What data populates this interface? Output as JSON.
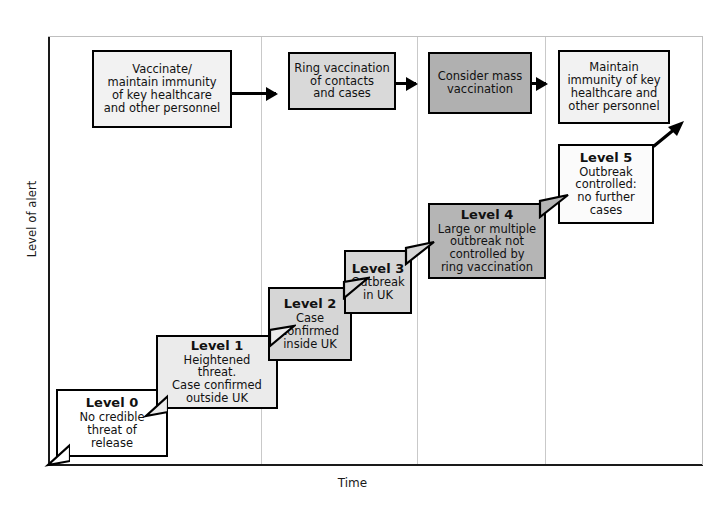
{
  "diagram": {
    "type": "step-escalation-diagram",
    "axes": {
      "y_label": "Level of alert",
      "x_label": "Time"
    },
    "colors": {
      "white": "#ffffff",
      "very_light_gray": "#ececec",
      "light_gray": "#dcdcdc",
      "medium_gray": "#c8c8c8",
      "dark_gray": "#a8a8a8",
      "outline": "#000000",
      "divider": "#c9c9c9",
      "axis": "#1a1a1a"
    }
  },
  "action_boxes": [
    {
      "id": "vaccinate-maintain-immunity",
      "text": "Vaccinate/\nmaintain immunity\nof key healthcare\nand other personnel",
      "fill": "#f2f2f2"
    },
    {
      "id": "ring-vaccination",
      "text": "Ring vaccination\nof contacts\nand cases",
      "fill": "#d9d9d9"
    },
    {
      "id": "consider-mass-vaccination",
      "text": "Consider mass\nvaccination",
      "fill": "#b0b0b0"
    },
    {
      "id": "maintain-immunity",
      "text": "Maintain\nimmunity of key\nhealthcare and\nother personnel",
      "fill": "#f2f2f2"
    }
  ],
  "level_boxes": [
    {
      "id": "level-0",
      "level": "Level 0",
      "description": "No credible\nthreat of\nrelease",
      "fill": "#ffffff"
    },
    {
      "id": "level-1",
      "level": "Level 1",
      "description": "Heightened\nthreat.\nCase confirmed\noutside UK",
      "fill": "#ebebeb"
    },
    {
      "id": "level-2",
      "level": "Level 2",
      "description": "Case\nconfirmed\ninside UK",
      "fill": "#d6d6d6"
    },
    {
      "id": "level-3",
      "level": "Level 3",
      "description": "Outbreak\nin UK",
      "fill": "#d6d6d6"
    },
    {
      "id": "level-4",
      "level": "Level 4",
      "description": "Large or multiple\noutbreak not\ncontrolled by\nring vaccination",
      "fill": "#b5b5b5"
    },
    {
      "id": "level-5",
      "level": "Level 5",
      "description": "Outbreak\ncontrolled:\nno further\ncases",
      "fill": "#fbfbfb"
    }
  ],
  "connectors": {
    "arrow_1": "arrow-right",
    "arrow_2": "arrow-right",
    "arrow_3": "arrow-right",
    "exit_arrow": "arrow-up-right"
  }
}
